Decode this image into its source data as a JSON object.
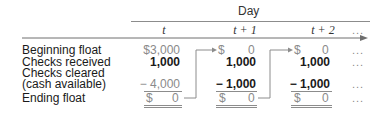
{
  "table": {
    "group_header": "Day",
    "columns": [
      {
        "label": "t",
        "style": "gray"
      },
      {
        "label": "t + 1",
        "style": "bold"
      },
      {
        "label": "t + 2",
        "style": "bold"
      },
      {
        "label": "..."
      }
    ],
    "rows": [
      {
        "label": "Beginning float",
        "values": [
          "$3,000",
          "$ 0",
          "$ 0",
          "..."
        ]
      },
      {
        "label": "Checks received",
        "values": [
          "1,000",
          "1,000",
          "1,000",
          "..."
        ]
      },
      {
        "label": "Checks cleared",
        "label2": "(cash available)",
        "values": [
          "− 4,000",
          "− 1,000",
          "− 1,000",
          "..."
        ]
      },
      {
        "label": "Ending float",
        "values": [
          "$ 0",
          "$ 0",
          "$ 0",
          "..."
        ]
      }
    ],
    "currency_symbol": "$",
    "zero": "0",
    "ellipsis": "..."
  },
  "colors": {
    "rule": "#8c8c8c",
    "text": "#1a1a1a",
    "muted": "#8a8a8a"
  }
}
